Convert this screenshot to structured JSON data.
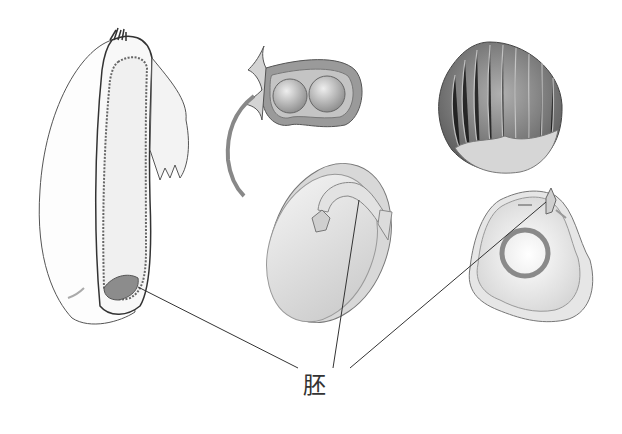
{
  "diagram": {
    "label": "胚",
    "specimens": [
      {
        "id": "grain-longitudinal-section"
      },
      {
        "id": "bean-pod-with-seeds"
      },
      {
        "id": "bean-seed-section"
      },
      {
        "id": "nut-in-cupule"
      },
      {
        "id": "nut-kernel-section"
      }
    ],
    "colors": {
      "line": "#444444",
      "fill_light": "#eeeeee",
      "fill_mid": "#aaaaaa",
      "fill_dark": "#777777"
    }
  }
}
